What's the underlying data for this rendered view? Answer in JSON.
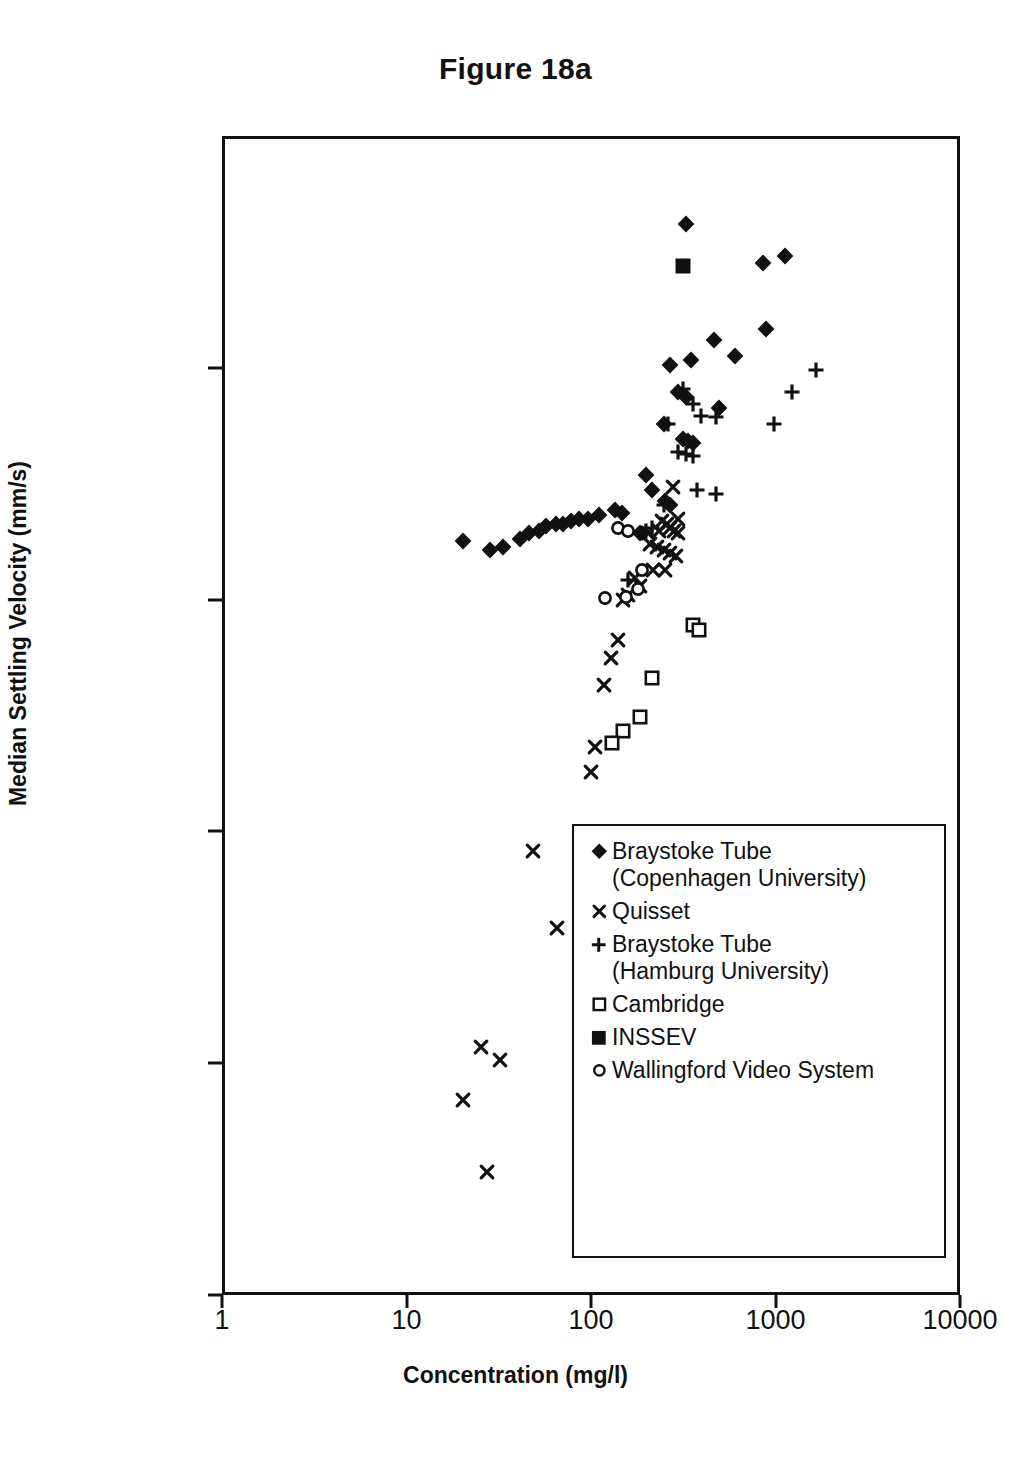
{
  "chart_data": {
    "type": "scatter",
    "title": "Figure 18a",
    "xlabel": "Concentration (mg/l)",
    "ylabel": "Median Settling Velocity (mm/s)",
    "xscale": "log",
    "yscale": "log",
    "xlim": [
      1,
      10000
    ],
    "ylim": [
      0.0001,
      10
    ],
    "xticks": [
      "1",
      "10",
      "100",
      "1000",
      "10000"
    ],
    "xtick_values": [
      1,
      10,
      100,
      1000,
      10000
    ],
    "yticks": [
      "10",
      "1",
      "0.1",
      "0.01",
      "0.001",
      "0.0001"
    ],
    "ytick_values": [
      10,
      1,
      0.1,
      0.01,
      0.001,
      0.0001
    ],
    "grid": false,
    "legend_position": "inside-bottom-right",
    "series": [
      {
        "name": "Braystoke Tube (Copenhagen University)",
        "marker": "filled-diamond",
        "color": "#111111",
        "points": [
          [
            330,
            4.3
          ],
          [
            870,
            2.9
          ],
          [
            1150,
            3.1
          ],
          [
            900,
            1.5
          ],
          [
            470,
            1.35
          ],
          [
            610,
            1.15
          ],
          [
            350,
            1.1
          ],
          [
            270,
            1.05
          ],
          [
            300,
            0.8
          ],
          [
            330,
            0.76
          ],
          [
            500,
            0.68
          ],
          [
            250,
            0.58
          ],
          [
            320,
            0.5
          ],
          [
            340,
            0.49
          ],
          [
            360,
            0.48
          ],
          [
            200,
            0.35
          ],
          [
            215,
            0.3
          ],
          [
            255,
            0.27
          ],
          [
            270,
            0.26
          ],
          [
            135,
            0.245
          ],
          [
            148,
            0.24
          ],
          [
            110,
            0.235
          ],
          [
            96,
            0.225
          ],
          [
            86,
            0.225
          ],
          [
            78,
            0.22
          ],
          [
            70,
            0.215
          ],
          [
            64,
            0.215
          ],
          [
            57,
            0.21
          ],
          [
            52,
            0.2
          ],
          [
            46,
            0.195
          ],
          [
            41,
            0.185
          ],
          [
            20,
            0.18
          ],
          [
            33,
            0.17
          ],
          [
            28,
            0.165
          ],
          [
            185,
            0.195
          ]
        ]
      },
      {
        "name": "Quisset",
        "marker": "x-cross",
        "color": "#111111",
        "points": [
          [
            280,
            0.31
          ],
          [
            300,
            0.225
          ],
          [
            245,
            0.22
          ],
          [
            260,
            0.215
          ],
          [
            270,
            0.205
          ],
          [
            285,
            0.2
          ],
          [
            300,
            0.195
          ],
          [
            235,
            0.2
          ],
          [
            205,
            0.195
          ],
          [
            210,
            0.175
          ],
          [
            230,
            0.17
          ],
          [
            250,
            0.165
          ],
          [
            270,
            0.16
          ],
          [
            290,
            0.155
          ],
          [
            255,
            0.135
          ],
          [
            218,
            0.135
          ],
          [
            175,
            0.125
          ],
          [
            185,
            0.115
          ],
          [
            160,
            0.105
          ],
          [
            150,
            0.1
          ],
          [
            140,
            0.067
          ],
          [
            128,
            0.056
          ],
          [
            118,
            0.043
          ],
          [
            105,
            0.023
          ],
          [
            100,
            0.018
          ],
          [
            48,
            0.0082
          ],
          [
            65,
            0.0038
          ],
          [
            25,
            0.00115
          ],
          [
            32,
            0.00101
          ],
          [
            20,
            0.00068
          ],
          [
            27,
            0.00033
          ]
        ]
      },
      {
        "name": "Braystoke Tube (Hamburg University)",
        "marker": "plus",
        "color": "#111111",
        "points": [
          [
            1700,
            1.0
          ],
          [
            1250,
            0.8
          ],
          [
            1000,
            0.58
          ],
          [
            320,
            0.82
          ],
          [
            360,
            0.71
          ],
          [
            400,
            0.63
          ],
          [
            480,
            0.62
          ],
          [
            265,
            0.58
          ],
          [
            300,
            0.44
          ],
          [
            330,
            0.43
          ],
          [
            360,
            0.42
          ],
          [
            380,
            0.3
          ],
          [
            480,
            0.29
          ],
          [
            250,
            0.26
          ],
          [
            215,
            0.205
          ],
          [
            200,
            0.2
          ],
          [
            160,
            0.122
          ]
        ]
      },
      {
        "name": "Cambridge",
        "marker": "open-square",
        "color": "#111111",
        "points": [
          [
            360,
            0.078
          ],
          [
            390,
            0.074
          ],
          [
            215,
            0.046
          ],
          [
            185,
            0.031
          ],
          [
            150,
            0.027
          ],
          [
            130,
            0.024
          ]
        ]
      },
      {
        "name": "INSSEV",
        "marker": "filled-square",
        "color": "#111111",
        "points": [
          [
            320,
            2.8
          ]
        ]
      },
      {
        "name": "Wallingford Video System",
        "marker": "open-circle",
        "color": "#111111",
        "points": [
          [
            140,
            0.205
          ],
          [
            160,
            0.2
          ],
          [
            190,
            0.135
          ],
          [
            155,
            0.103
          ],
          [
            180,
            0.112
          ],
          [
            120,
            0.102
          ]
        ]
      }
    ]
  },
  "legend": {
    "entries": [
      {
        "marker": "filled-diamond",
        "label": "Braystoke Tube\n(Copenhagen University)"
      },
      {
        "marker": "x-cross",
        "label": "Quisset"
      },
      {
        "marker": "plus",
        "label": "Braystoke Tube\n(Hamburg University)"
      },
      {
        "marker": "open-square",
        "label": "Cambridge"
      },
      {
        "marker": "filled-square",
        "label": "INSSEV"
      },
      {
        "marker": "open-circle",
        "label": "Wallingford Video System"
      }
    ]
  }
}
